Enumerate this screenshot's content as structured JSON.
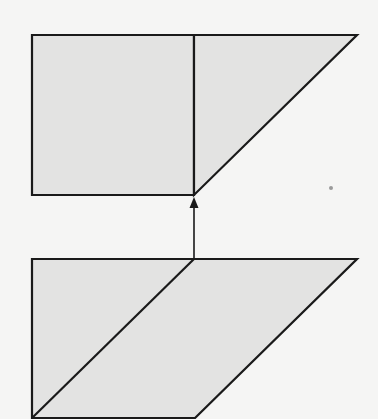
{
  "diagram": {
    "colors": {
      "background": "#f5f5f4",
      "fill": "#e3e3e2",
      "stroke": "#1a1a1a",
      "speck": "#9a9a9a"
    },
    "top_figure": {
      "square": [
        [
          32,
          35
        ],
        [
          194,
          35
        ],
        [
          194,
          195
        ],
        [
          32,
          195
        ]
      ],
      "triangle": [
        [
          194,
          35
        ],
        [
          357,
          35
        ],
        [
          194,
          195
        ]
      ]
    },
    "arrow": {
      "from": [
        194,
        259
      ],
      "to": [
        194,
        197
      ],
      "direction": "up"
    },
    "bottom_figure": {
      "parallelogram": [
        [
          32,
          259
        ],
        [
          357,
          259
        ],
        [
          195,
          418
        ],
        [
          32,
          418
        ]
      ],
      "diagonal": [
        [
          194,
          259
        ],
        [
          32,
          418
        ]
      ]
    }
  }
}
